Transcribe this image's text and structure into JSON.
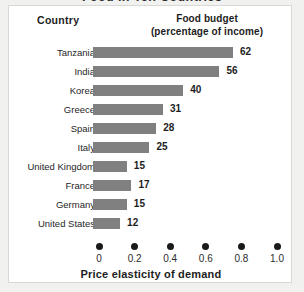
{
  "title_clipped": "Food in Ten Countries",
  "panel": {
    "headers": {
      "country": "Country",
      "budget_line1": "Food budget",
      "budget_line2": "(percentage of income)"
    }
  },
  "chart_data": {
    "type": "bar",
    "title": "Food in Ten Countries",
    "orientation": "horizontal",
    "categories": [
      "Tanzania",
      "India",
      "Korea",
      "Greece",
      "Spain",
      "Italy",
      "United Kingdom",
      "France",
      "Germany",
      "United States"
    ],
    "values": [
      62,
      56,
      40,
      31,
      28,
      25,
      15,
      17,
      15,
      12
    ],
    "value_labels": [
      "62",
      "56",
      "40",
      "31",
      "28",
      "25",
      "15",
      "17",
      "15",
      "12"
    ],
    "series_name": "Food budget (percentage of income)",
    "xlabel": "Price elasticity of demand",
    "ylabel": "Country",
    "xticks": [
      0,
      0.2,
      0.4,
      0.6,
      0.8,
      1.0
    ],
    "xtick_labels": [
      "0",
      "0.2",
      "0.4",
      "0.6",
      "0.8",
      "1.0"
    ],
    "xlim": [
      0,
      1.0
    ],
    "grid": false,
    "legend": "none",
    "bar_color": "#808080",
    "bar_max_value": 62,
    "axis_marker_style": "filled-circle"
  }
}
